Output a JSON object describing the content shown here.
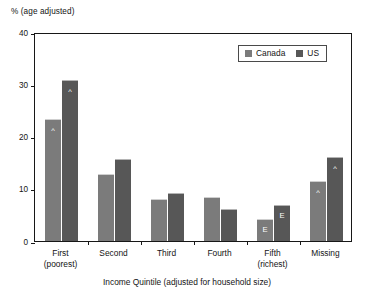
{
  "chart_data": {
    "type": "bar",
    "title": "",
    "xlabel": "Income Quintile (adjusted for household size)",
    "ylabel": "% (age adjusted)",
    "ylim": [
      0,
      40
    ],
    "yticks": [
      0,
      10,
      20,
      30,
      40
    ],
    "grid": false,
    "legend_position": "top-right",
    "categories": [
      "First\n(poorest)",
      "Second",
      "Third",
      "Fourth",
      "Fifth\n(richest)",
      "Missing"
    ],
    "category_lines": [
      {
        "line1": "First",
        "line2": "(poorest)"
      },
      {
        "line1": "Second",
        "line2": ""
      },
      {
        "line1": "Third",
        "line2": ""
      },
      {
        "line1": "Fourth",
        "line2": ""
      },
      {
        "line1": "Fifth",
        "line2": "(richest)"
      },
      {
        "line1": "Missing",
        "line2": ""
      }
    ],
    "series": [
      {
        "name": "Canada",
        "color": "#7b7b7b",
        "values": [
          23.4,
          12.9,
          8.0,
          8.4,
          4.2,
          11.5
        ],
        "flags": [
          "^",
          "",
          "",
          "",
          "E",
          "^"
        ]
      },
      {
        "name": "US",
        "color": "#575757",
        "values": [
          30.8,
          15.7,
          9.2,
          6.2,
          6.8,
          16.0
        ],
        "flags": [
          "^",
          "",
          "",
          "",
          "E",
          "^"
        ]
      }
    ]
  },
  "legend": {
    "items": [
      {
        "label": "Canada",
        "swatch": "canada"
      },
      {
        "label": "US",
        "swatch": "us"
      }
    ]
  },
  "axis": {
    "y_unit_caption": "% (age adjusted)",
    "y_tick_labels": [
      "40",
      "30",
      "20",
      "10",
      "0"
    ],
    "x_title": "Income Quintile (adjusted for household size)"
  }
}
